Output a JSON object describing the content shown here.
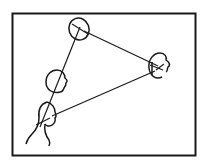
{
  "diagram": {
    "type": "sociogram-line-drawing",
    "stroke_color": "#1a1a1a",
    "background": "#ffffff",
    "frame": {
      "x": 12,
      "y": 13,
      "width": 184,
      "height": 143
    },
    "nodes": [
      {
        "id": "top-head",
        "label": "",
        "cx": 79,
        "cy": 29
      },
      {
        "id": "right-head",
        "label": "",
        "cx": 158,
        "cy": 67
      },
      {
        "id": "middle-head",
        "label": "",
        "cx": 56,
        "cy": 82
      },
      {
        "id": "lower-left-head",
        "label": "",
        "cx": 49,
        "cy": 114
      }
    ],
    "edges": [
      {
        "from": "top-head",
        "to": "right-head"
      },
      {
        "from": "top-head",
        "to": "lower-left-head"
      },
      {
        "from": "lower-left-head",
        "to": "right-head"
      }
    ]
  }
}
